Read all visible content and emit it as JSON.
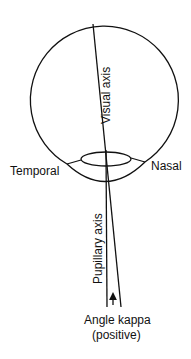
{
  "diagram": {
    "labels": {
      "visual_axis": "Visual axis",
      "temporal": "Temporal",
      "nasal": "Nasal",
      "pupillary_axis": "Pupillary axis",
      "angle_kappa_line1": "Angle kappa",
      "angle_kappa_line2": "(positive)"
    },
    "colors": {
      "line": "#111111",
      "background": "#ffffff"
    }
  }
}
